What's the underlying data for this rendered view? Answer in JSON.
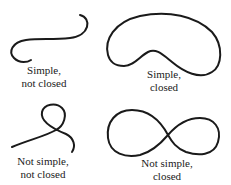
{
  "diagram": {
    "panels": [
      {
        "id": "simple-not-closed",
        "line1": "Simple,",
        "line2": "not closed"
      },
      {
        "id": "simple-closed",
        "line1": "Simple,",
        "line2": "closed"
      },
      {
        "id": "not-simple-not-closed",
        "line1": "Not simple,",
        "line2": "not closed"
      },
      {
        "id": "not-simple-closed",
        "line1": "Not simple,",
        "line2": "closed"
      }
    ],
    "colors": {
      "stroke": "#1a1a1a",
      "background": "#ffffff"
    }
  }
}
